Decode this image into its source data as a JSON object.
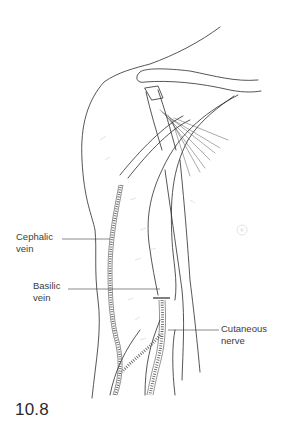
{
  "figure": {
    "number": "10.8"
  },
  "labels": {
    "cephalic_vein": "Cephalic\nvein",
    "basilic_vein": "Basilic\nvein",
    "cutaneous_nerve": "Cutaneous\nnerve"
  },
  "colors": {
    "line": "#2b2b2b",
    "hatch": "#555555",
    "text": "#3c3c3c",
    "background": "#ffffff"
  }
}
